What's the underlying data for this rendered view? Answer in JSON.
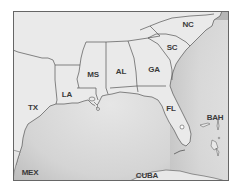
{
  "map": {
    "title": "Southeastern United States and Gulf of Mexico",
    "colors": {
      "land": "#eaeaea",
      "water_light": "#e2e2e2",
      "water_dark": "#b9b9b9",
      "border": "#555555",
      "frame": "#666666",
      "label": "#3a3a3a"
    },
    "labels": [
      {
        "id": "nc",
        "text": "NC",
        "x": 188,
        "y": 25
      },
      {
        "id": "sc",
        "text": "SC",
        "x": 172,
        "y": 48
      },
      {
        "id": "ga",
        "text": "GA",
        "x": 154,
        "y": 70
      },
      {
        "id": "al",
        "text": "AL",
        "x": 121,
        "y": 72
      },
      {
        "id": "ms",
        "text": "MS",
        "x": 93,
        "y": 75
      },
      {
        "id": "la",
        "text": "LA",
        "x": 67,
        "y": 95
      },
      {
        "id": "tx",
        "text": "TX",
        "x": 33,
        "y": 108
      },
      {
        "id": "fl",
        "text": "FL",
        "x": 171,
        "y": 109
      },
      {
        "id": "bah",
        "text": "BAH",
        "x": 215,
        "y": 118
      },
      {
        "id": "mex",
        "text": "MEX",
        "x": 30,
        "y": 173
      },
      {
        "id": "cuba",
        "text": "CUBA",
        "x": 147,
        "y": 176
      }
    ]
  }
}
